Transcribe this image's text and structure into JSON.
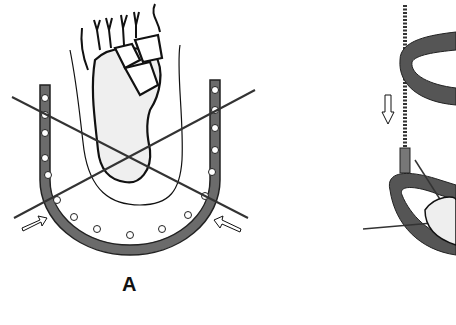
{
  "figure": {
    "panels": [
      {
        "id": "A",
        "label": "A",
        "subject": "foot-with-u-shaped-frame-and-crossed-wires"
      },
      {
        "id": "B",
        "label": "",
        "subject": "ring-fixator-with-threaded-rod"
      }
    ],
    "colors": {
      "frame": "#6b6b6b",
      "line": "#111111",
      "bone_fill": "#eeeeee",
      "background": "#ffffff"
    }
  }
}
